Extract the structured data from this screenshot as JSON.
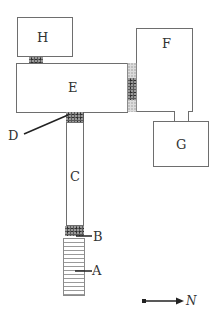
{
  "diagram": {
    "type": "floor-plan",
    "rooms": [
      {
        "id": "H",
        "label": "H"
      },
      {
        "id": "E",
        "label": "E"
      },
      {
        "id": "F",
        "label": "F"
      },
      {
        "id": "G",
        "label": "G"
      },
      {
        "id": "C",
        "label": "C"
      }
    ],
    "features": [
      {
        "id": "A",
        "label": "A",
        "kind": "stairs"
      },
      {
        "id": "B",
        "label": "B",
        "kind": "doorway"
      },
      {
        "id": "D",
        "label": "D",
        "kind": "doorway"
      }
    ],
    "north_arrow": {
      "label": "N",
      "direction": "right"
    },
    "colors": {
      "line": "#6e6e6e",
      "label": "#333333",
      "dark_fill": "#5a5a5a",
      "light_fill": "#dcdcdc"
    }
  }
}
